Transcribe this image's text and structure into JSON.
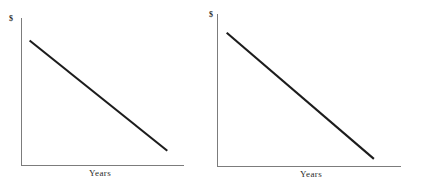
{
  "figure": {
    "background_color": "#ffffff",
    "axis_color": "#7c7c7c",
    "line_color": "#1c1c1c"
  },
  "chart_data": [
    {
      "type": "line",
      "title": "",
      "subtitle": "",
      "xlabel": "Years",
      "ylabel": "$",
      "panel": "left",
      "grid": false,
      "legend": "none",
      "xlim": [
        0,
        10
      ],
      "ylim": [
        0,
        10
      ],
      "x": [
        0.5,
        9.0
      ],
      "series": [
        {
          "name": "Straight-line decline",
          "values": [
            8.5,
            1.0
          ]
        }
      ],
      "annotations": []
    },
    {
      "type": "line",
      "title": "",
      "subtitle": "",
      "xlabel": "Years",
      "ylabel": "$",
      "panel": "right",
      "grid": false,
      "legend": "none",
      "xlim": [
        0,
        10
      ],
      "ylim": [
        0,
        10
      ],
      "x": [
        0.5,
        8.5
      ],
      "series": [
        {
          "name": "Straight-line decline",
          "values": [
            8.8,
            0.5
          ]
        }
      ],
      "annotations": []
    }
  ],
  "panels": {
    "left": {
      "ylabel": "$",
      "xlabel": "Years"
    },
    "right": {
      "ylabel": "$",
      "xlabel": "Years"
    }
  }
}
